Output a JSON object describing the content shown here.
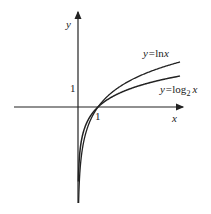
{
  "diagram": {
    "type": "function-graph",
    "axes": {
      "x_label": "x",
      "y_label": "y",
      "x_tick": "1",
      "y_tick": "1"
    },
    "curves": [
      {
        "id": "upper",
        "label_prefix": "y=",
        "label_fn": "ln",
        "label_var": "x",
        "label_sub": ""
      },
      {
        "id": "lower",
        "label_prefix": "y=",
        "label_fn": "log",
        "label_sub": "2",
        "label_var": "x"
      }
    ],
    "colors": {
      "stroke": "#222222",
      "background": "#ffffff"
    }
  }
}
